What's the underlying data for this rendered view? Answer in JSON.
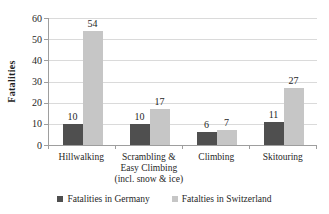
{
  "chart_data": {
    "type": "bar",
    "title": "",
    "categories": [
      "Hillwalking",
      "Scrambling &\nEasy Climbing\n(incl. snow & ice)",
      "Climbing",
      "Skitouring"
    ],
    "series": [
      {
        "name": "Fatalities in Germany",
        "values": [
          10,
          10,
          6,
          11
        ],
        "color": "#4f4f4f"
      },
      {
        "name": "Fatalties in Switzerland",
        "values": [
          54,
          17,
          7,
          27
        ],
        "color": "#c6c6c6"
      }
    ],
    "ylabel": "Fatalities",
    "ylim": [
      0,
      60
    ],
    "yticks": [
      0,
      10,
      20,
      30,
      40,
      50,
      60
    ],
    "grid": true,
    "legend_position": "bottom"
  },
  "colors": {
    "background": "#ffffff",
    "gridline": "#dadada",
    "axis": "#9e9e9e",
    "text": "#1f1f1f"
  }
}
